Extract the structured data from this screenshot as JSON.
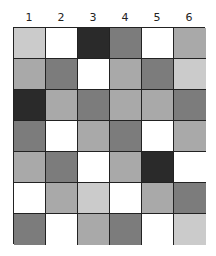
{
  "columns": [
    "1",
    "2",
    "3",
    "4",
    "5",
    "6"
  ],
  "palette": {
    "black": "#2a2a2a",
    "dark": "#7c7c7c",
    "mid": "#a9a9a9",
    "light": "#cbcbcb",
    "white": "#ffffff"
  },
  "grid": [
    [
      "light",
      "white",
      "black",
      "dark",
      "white",
      "mid"
    ],
    [
      "mid",
      "dark",
      "white",
      "mid",
      "dark",
      "light"
    ],
    [
      "black",
      "mid",
      "dark",
      "mid",
      "mid",
      "dark"
    ],
    [
      "dark",
      "white",
      "mid",
      "dark",
      "white",
      "mid"
    ],
    [
      "mid",
      "dark",
      "white",
      "mid",
      "black",
      "white"
    ],
    [
      "white",
      "mid",
      "light",
      "white",
      "mid",
      "dark"
    ],
    [
      "dark",
      "white",
      "mid",
      "dark",
      "white",
      "light"
    ]
  ]
}
